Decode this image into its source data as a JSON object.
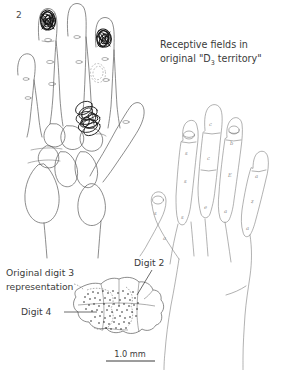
{
  "figure": {
    "panel_label": "2",
    "title_line1": "Receptive fields in",
    "title_line2_pre": "original \"D",
    "title_line2_sub": "3",
    "title_line2_post": " territory\"",
    "scale_bar_label": "1.0 mm",
    "background_color": "#ffffff",
    "ink_color": "#3b3b3b",
    "outline_color": "#5a5a5a",
    "receptive_field_color": "#141414"
  },
  "annotations": {
    "original_digit3_line1": "Original digit 3",
    "original_digit3_line2": "representation",
    "digit2": "Digit 2",
    "digit4": "Digit 4"
  },
  "left_hand": {
    "name": "dorsal-hand-with-receptive-fields",
    "receptive_field_patches": [
      {
        "id": "rf-digit2-tip",
        "location": "index-fingertip",
        "style": "dense-scribble"
      },
      {
        "id": "rf-digit4-tip",
        "location": "ring-fingertip",
        "style": "dense-scribble"
      },
      {
        "id": "rf-palm",
        "location": "distal-palm",
        "style": "overlapping-ellipses"
      },
      {
        "id": "rf-digit3-middle",
        "location": "middle-finger-middle-phalanx",
        "style": "dashed-oval"
      }
    ]
  },
  "right_hand": {
    "name": "palmar-hand-with-segment-letters",
    "segment_letters": [
      {
        "digit": 2,
        "letters": [
          "s",
          "s",
          "s"
        ]
      },
      {
        "digit": 3,
        "letters": [
          "c",
          "c",
          "e"
        ]
      },
      {
        "digit": 4,
        "letters": [
          "b",
          "E",
          "a"
        ]
      },
      {
        "digit": 5,
        "letters": [
          "a",
          "z",
          "a"
        ]
      },
      {
        "digit": 1,
        "letters": [
          "s",
          "a"
        ]
      }
    ]
  },
  "cortical_map": {
    "name": "cortical-representation-map",
    "stipple_description": "dotted region marking original digit 3 representation",
    "regions": [
      "Original digit 3 representation",
      "Digit 2",
      "Digit 4"
    ]
  }
}
